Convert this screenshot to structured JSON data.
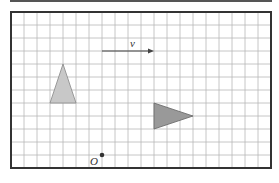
{
  "figure": {
    "grid": {
      "origin_px": [
        11,
        12
      ],
      "cell_px": 13,
      "cols": 20,
      "rows": 12,
      "line_color": "#b8b8b8",
      "frame_color": "#333333"
    },
    "vector": {
      "label": "v",
      "from": [
        7,
        3
      ],
      "to": [
        11,
        3
      ],
      "color": "#444444"
    },
    "shapes": [
      {
        "name": "triangle-object",
        "points": [
          [
            4,
            4
          ],
          [
            3,
            7
          ],
          [
            5,
            7
          ]
        ],
        "fill": "#c8c8c8",
        "stroke": "#888888"
      },
      {
        "name": "triangle-image",
        "points": [
          [
            11,
            7
          ],
          [
            11,
            9
          ],
          [
            14,
            8
          ]
        ],
        "fill": "#999999",
        "stroke": "#666666"
      }
    ],
    "point": {
      "label": "O",
      "at": [
        7,
        11
      ],
      "color": "#333333"
    }
  }
}
